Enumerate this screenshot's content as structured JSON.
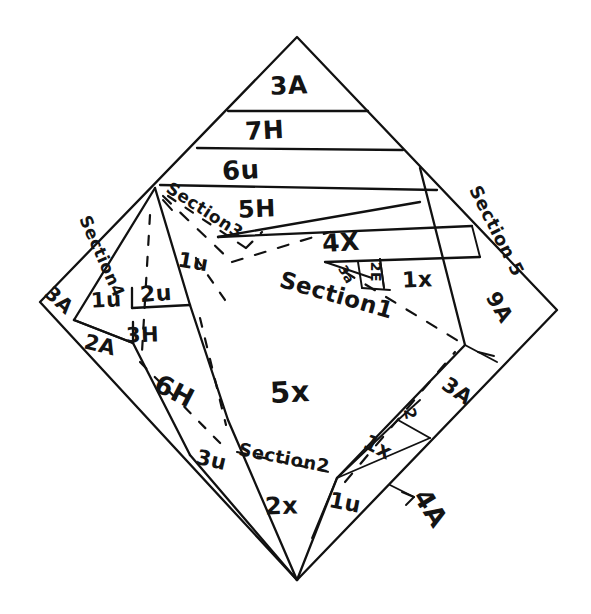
{
  "figure": {
    "background_color": "#ffffff",
    "ink_color": "#111111"
  },
  "sections": {
    "section1": {
      "label": "Section1",
      "value": "5x"
    },
    "section2": {
      "label": "Section2",
      "value": "2x"
    },
    "section3": {
      "label": "Section3",
      "value": "1u"
    },
    "section4": {
      "label": "Section4",
      "value": "3A"
    },
    "section5": {
      "label": "Section 5",
      "value": "9A"
    }
  },
  "top_bands": [
    {
      "name": "band-3a",
      "label": "3A"
    },
    {
      "name": "band-7h",
      "label": "7H"
    },
    {
      "name": "band-6u",
      "label": "6u"
    },
    {
      "name": "band-5h",
      "label": "5H"
    },
    {
      "name": "band-4x",
      "label": "4X"
    }
  ],
  "left_cells": [
    {
      "name": "cell-corner-3a",
      "label": "3A"
    },
    {
      "name": "cell-1u",
      "label": "1u"
    },
    {
      "name": "cell-2u",
      "label": "2u"
    },
    {
      "name": "cell-2a",
      "label": "2A"
    },
    {
      "name": "cell-3h",
      "label": "3H"
    },
    {
      "name": "cell-6h",
      "label": "6H"
    }
  ],
  "right_cells": [
    {
      "name": "cell-3a-small",
      "label": "3a"
    },
    {
      "name": "cell-2e",
      "label": "2E"
    },
    {
      "name": "cell-1x-upper",
      "label": "1x"
    },
    {
      "name": "cell-9a",
      "label": "9A"
    },
    {
      "name": "cell-3a-right",
      "label": "3A"
    },
    {
      "name": "cell-2-small",
      "label": "2"
    },
    {
      "name": "cell-1x-lower",
      "label": "1x"
    }
  ],
  "bottom_cells": [
    {
      "name": "cell-3u",
      "label": "3u"
    },
    {
      "name": "cell-2x",
      "label": "2x"
    },
    {
      "name": "cell-1u-bottom",
      "label": "1u"
    }
  ],
  "annotations": [
    {
      "name": "callout-4a",
      "label": "4A",
      "arrow": "arrow-right-icon"
    }
  ],
  "center_labels": {
    "section1_label": "Section1",
    "section1_value": "5x"
  }
}
